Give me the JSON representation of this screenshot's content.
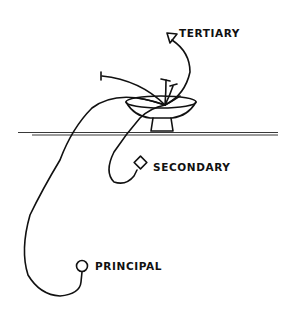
{
  "diagram": {
    "labels": {
      "tertiary": "TERTIARY",
      "secondary": "SECONDARY",
      "principal": "PRINCIPAL"
    },
    "markers": {
      "tertiary": "triangle",
      "secondary": "diamond",
      "principal": "circle"
    },
    "colors": {
      "ink": "#111111",
      "background": "#ffffff"
    }
  }
}
